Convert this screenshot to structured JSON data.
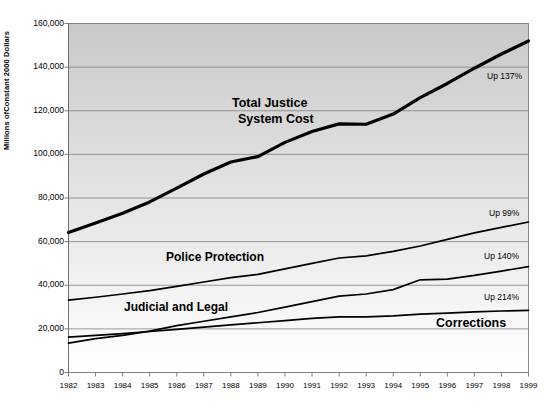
{
  "chart_data": {
    "type": "line",
    "title": "",
    "xlabel": "",
    "ylabel": "Millions ofConstant 2000 Dollars",
    "ylim": [
      0,
      160000
    ],
    "xlim": [
      1982,
      1999
    ],
    "grid": true,
    "legend_position": "inline-labels",
    "categories": [
      "1982",
      "1983",
      "1984",
      "1985",
      "1986",
      "1987",
      "1988",
      "1989",
      "1990",
      "1991",
      "1992",
      "1993",
      "1994",
      "1995",
      "1996",
      "1997",
      "1998",
      "1999"
    ],
    "y_ticks": [
      "0",
      "20,000",
      "40,000",
      "60,000",
      "80,000",
      "100,000",
      "120,000",
      "140,000",
      "160,000"
    ],
    "y_tick_values": [
      0,
      20000,
      40000,
      60000,
      80000,
      100000,
      120000,
      140000,
      160000
    ],
    "series": [
      {
        "name": "Total Justice System Cost",
        "label_line1": "Total Justice",
        "label_line2": "System Cost",
        "annotation": "Up 137%",
        "color": "#000000",
        "width": 3.2,
        "values": [
          64200,
          68500,
          73000,
          78200,
          84500,
          91000,
          96500,
          99000,
          105500,
          110500,
          114000,
          113800,
          118500,
          126000,
          132500,
          139500,
          146000,
          152000
        ]
      },
      {
        "name": "Police Protection",
        "label_line1": "Police Protection",
        "label_line2": "",
        "annotation": "Up 99%",
        "color": "#000000",
        "width": 1.7,
        "values": [
          33200,
          34500,
          36000,
          37500,
          39500,
          41500,
          43500,
          45000,
          47500,
          50000,
          52500,
          53500,
          55500,
          58000,
          61000,
          64000,
          66500,
          69000
        ]
      },
      {
        "name": "Judicial and Legal",
        "label_line1": "Judicial and Legal",
        "label_line2": "",
        "annotation": "Up 140%",
        "color": "#000000",
        "width": 1.7,
        "values": [
          13500,
          15500,
          17000,
          19000,
          21500,
          23500,
          25500,
          27500,
          30000,
          32500,
          35000,
          36000,
          38000,
          42500,
          42800,
          44500,
          46500,
          48500
        ]
      },
      {
        "name": "Corrections",
        "label_line1": "Corrections",
        "label_line2": "",
        "annotation": "Up 214%",
        "color": "#000000",
        "width": 1.7,
        "values": [
          16200,
          17000,
          17800,
          18800,
          19800,
          20800,
          21800,
          22800,
          23800,
          24800,
          25500,
          25500,
          26000,
          26800,
          27200,
          27800,
          28200,
          28500
        ]
      }
    ]
  },
  "plot": {
    "background_top_color": "#c9c9c9",
    "background_bottom_color": "#ffffff",
    "gridline_color": "#808080",
    "border_color": "#808080"
  }
}
